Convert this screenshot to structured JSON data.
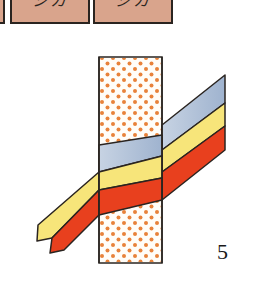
{
  "header_boxes": [
    {
      "label": "",
      "x": -6,
      "width": 11
    },
    {
      "label": "シカ",
      "x": 10,
      "width": 80
    },
    {
      "label": "ジカ",
      "x": 93,
      "width": 80
    }
  ],
  "colors": {
    "box_fill": "#d9a48c",
    "outline": "#2a2420",
    "band_blue": "#a9bcd6",
    "band_yellow": "#f7e57a",
    "band_red": "#e8401e",
    "dot": "#e8823a",
    "block_fill": "#fffdf8"
  },
  "diagram": {
    "block": {
      "x": 99,
      "y": 57,
      "width": 63,
      "height": 206
    },
    "bands": [
      "blue",
      "yellow",
      "red"
    ]
  },
  "figure_number": "5"
}
